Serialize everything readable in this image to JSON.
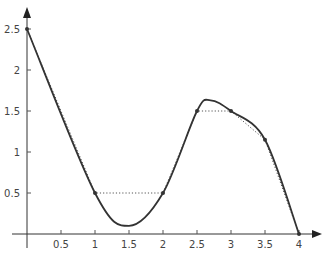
{
  "chart_data": {
    "type": "line",
    "title": "",
    "xlabel": "",
    "ylabel": "",
    "xlim": [
      0,
      4.3
    ],
    "ylim": [
      0,
      2.7
    ],
    "grid": false,
    "legend": null,
    "x_ticks": [
      "0.5",
      "1",
      "1.5",
      "2",
      "2.5",
      "3",
      "3.5",
      "4"
    ],
    "y_ticks": [
      "0.5",
      "1",
      "1.5",
      "2",
      "2.5"
    ],
    "series": [
      {
        "name": "data points (dotted polyline)",
        "style": "dotted",
        "x": [
          0,
          1,
          2,
          2.5,
          3,
          3.5,
          4
        ],
        "y": [
          2.5,
          0.5,
          0.5,
          1.5,
          1.5,
          1.15,
          0
        ]
      },
      {
        "name": "interpolating curve (solid)",
        "style": "solid",
        "x": [
          0,
          1,
          1.5,
          2,
          2.5,
          2.7,
          3,
          3.5,
          4
        ],
        "y": [
          2.5,
          0.5,
          0.1,
          0.5,
          1.5,
          1.63,
          1.5,
          1.15,
          0
        ]
      }
    ],
    "colors": {
      "axis": "#333333",
      "curve": "#333333",
      "dotted": "#555555",
      "tick_label": "#444444"
    }
  }
}
